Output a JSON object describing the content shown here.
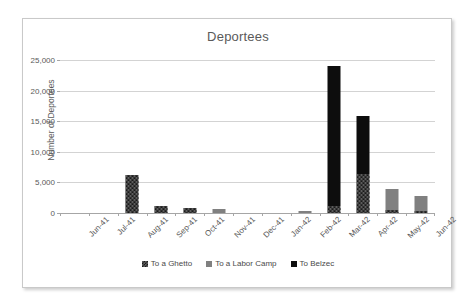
{
  "chart_data": {
    "type": "bar",
    "stacked": true,
    "title": "Deportees",
    "xlabel": "",
    "ylabel": "Number of Deportees",
    "ylim": [
      0,
      25000
    ],
    "yticks": [
      0,
      5000,
      10000,
      15000,
      20000,
      25000
    ],
    "ytick_labels": [
      "0",
      "5,000",
      "10,000",
      "15,000",
      "20,000",
      "25,000"
    ],
    "grid": true,
    "legend_position": "bottom",
    "categories": [
      "Jun-41",
      "Jul-41",
      "Aug-41",
      "Sep-41",
      "Oct-41",
      "Nov-41",
      "Dec-41",
      "Jan-42",
      "Feb-42",
      "Mar-42",
      "Apr-42",
      "May-42",
      "Jun-42"
    ],
    "series": [
      {
        "name": "To a Ghetto",
        "color": "#1a1a1a",
        "pattern": "checkerboard-hatch",
        "values": [
          0,
          0,
          6200,
          1100,
          900,
          0,
          0,
          0,
          0,
          1200,
          6400,
          500,
          400
        ]
      },
      {
        "name": "To a Labor Camp",
        "color": "#808080",
        "pattern": "solid",
        "values": [
          0,
          0,
          0,
          0,
          0,
          600,
          0,
          0,
          300,
          0,
          0,
          3400,
          2400
        ]
      },
      {
        "name": "To Belzec",
        "color": "#0d0d0d",
        "pattern": "solid",
        "values": [
          0,
          0,
          0,
          0,
          0,
          0,
          0,
          0,
          0,
          22800,
          9500,
          0,
          0
        ]
      }
    ],
    "totals": [
      0,
      0,
      6200,
      1100,
      900,
      600,
      0,
      0,
      300,
      24000,
      15900,
      3900,
      2800
    ]
  }
}
